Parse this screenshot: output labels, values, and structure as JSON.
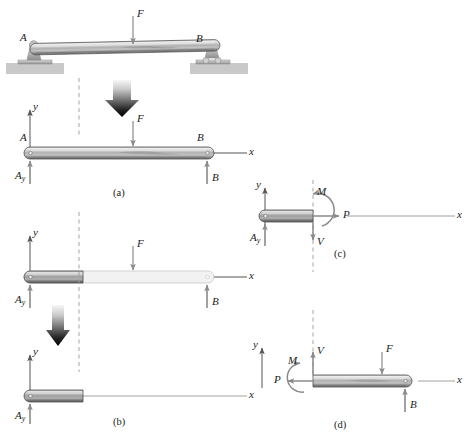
{
  "figure": {
    "captions": {
      "a": "(a)",
      "b": "(b)",
      "c": "(c)",
      "d": "(d)"
    },
    "colors": {
      "beam_light": "#e8e8e8",
      "beam_mid": "#9a9a9a",
      "beam_dark": "#6e6e6e",
      "beam_outline": "#4d4d4d",
      "ghost": "#f2f2f2",
      "ghost_outline": "#c8c8c8",
      "support": "#b9b9b9",
      "ground": "#c9c9c9",
      "arrow": "#8a8a8a",
      "arrow_dark": "#111111",
      "dashed": "#9a9a9a",
      "axis": "#555555",
      "text": "#1a1a1a"
    }
  },
  "panel_a": {
    "caption": "(a)",
    "top_view": {
      "label_A": "A",
      "label_B": "B",
      "load_label": "F"
    },
    "fbd": {
      "axis_y": "y",
      "axis_x": "x",
      "label_A": "A",
      "label_B": "B",
      "load_label": "F",
      "reaction_left": "A",
      "reaction_left_sub": "y",
      "reaction_right": "B"
    }
  },
  "panel_b": {
    "caption": "(b)",
    "upper": {
      "axis_y": "y",
      "axis_x": "x",
      "load_label": "F",
      "reaction_left": "A",
      "reaction_left_sub": "y",
      "reaction_right": "B"
    },
    "lower": {
      "axis_y": "y",
      "axis_x": "x",
      "reaction_left": "A",
      "reaction_left_sub": "y"
    }
  },
  "panel_c": {
    "caption": "(c)",
    "axis_y": "y",
    "axis_x": "x",
    "reaction_left": "A",
    "reaction_left_sub": "y",
    "moment_label": "M",
    "axial_label": "P",
    "shear_label": "V"
  },
  "panel_d": {
    "caption": "(d)",
    "axis_y": "y",
    "axis_x": "x",
    "moment_label": "M",
    "axial_label": "P",
    "shear_label": "V",
    "load_label": "F",
    "reaction_right": "B"
  }
}
